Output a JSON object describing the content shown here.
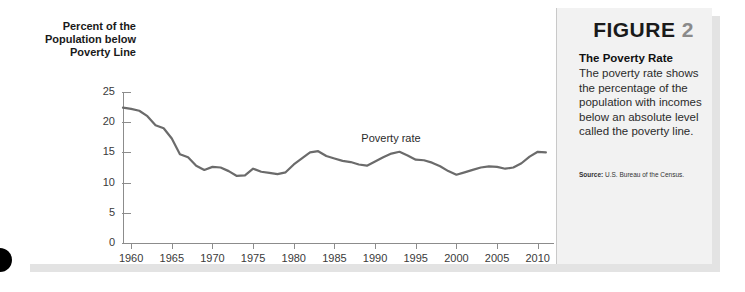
{
  "figure": {
    "heading_word": "FIGURE",
    "heading_number": "2",
    "title": "The Poverty Rate",
    "body": "The poverty rate shows the percentage of the population with incomes below an absolute level called the poverty line.",
    "source_label": "Source:",
    "source_text": "U.S. Bureau of the Census."
  },
  "colors": {
    "line": "#6b6b6b",
    "axis": "#8c8c8c",
    "panel_bg": "#f2f2f2",
    "chart_bg": "#ffffff",
    "heading_dark": "#1a1a1a",
    "heading_gray": "#8a8a8a"
  },
  "chart_data": {
    "type": "line",
    "title": "",
    "xlabel": "",
    "ylabel": "Percent of the Population below Poverty Line",
    "xlim": [
      1959,
      2012
    ],
    "ylim": [
      0,
      25
    ],
    "yticks": [
      0,
      5,
      10,
      15,
      20,
      25
    ],
    "ytick_labels": [
      "0",
      "5",
      "10",
      "15",
      "20",
      "25"
    ],
    "xticks": [
      1960,
      1965,
      1970,
      1975,
      1980,
      1985,
      1990,
      1995,
      2000,
      2005,
      2010
    ],
    "xtick_labels": [
      "1960",
      "1965",
      "1970",
      "1975",
      "1980",
      "1985",
      "1990",
      "1995",
      "2000",
      "2005",
      "2010"
    ],
    "grid": false,
    "legend": "none",
    "annotations": [
      {
        "text": "Poverty rate",
        "x": 1992,
        "y": 17.2
      }
    ],
    "series": [
      {
        "name": "Poverty rate",
        "x": [
          1959,
          1960,
          1961,
          1962,
          1963,
          1964,
          1965,
          1966,
          1967,
          1968,
          1969,
          1970,
          1971,
          1972,
          1973,
          1974,
          1975,
          1976,
          1977,
          1978,
          1979,
          1980,
          1981,
          1982,
          1983,
          1984,
          1985,
          1986,
          1987,
          1988,
          1989,
          1990,
          1991,
          1992,
          1993,
          1994,
          1995,
          1996,
          1997,
          1998,
          1999,
          2000,
          2001,
          2002,
          2003,
          2004,
          2005,
          2006,
          2007,
          2008,
          2009,
          2010,
          2011
        ],
        "values": [
          22.4,
          22.2,
          21.9,
          21.0,
          19.5,
          19.0,
          17.3,
          14.7,
          14.2,
          12.8,
          12.1,
          12.6,
          12.5,
          11.9,
          11.1,
          11.2,
          12.3,
          11.8,
          11.6,
          11.4,
          11.7,
          13.0,
          14.0,
          15.0,
          15.2,
          14.4,
          14.0,
          13.6,
          13.4,
          13.0,
          12.8,
          13.5,
          14.2,
          14.8,
          15.1,
          14.5,
          13.8,
          13.7,
          13.3,
          12.7,
          11.9,
          11.3,
          11.7,
          12.1,
          12.5,
          12.7,
          12.6,
          12.3,
          12.5,
          13.2,
          14.3,
          15.1,
          15.0
        ]
      }
    ]
  }
}
